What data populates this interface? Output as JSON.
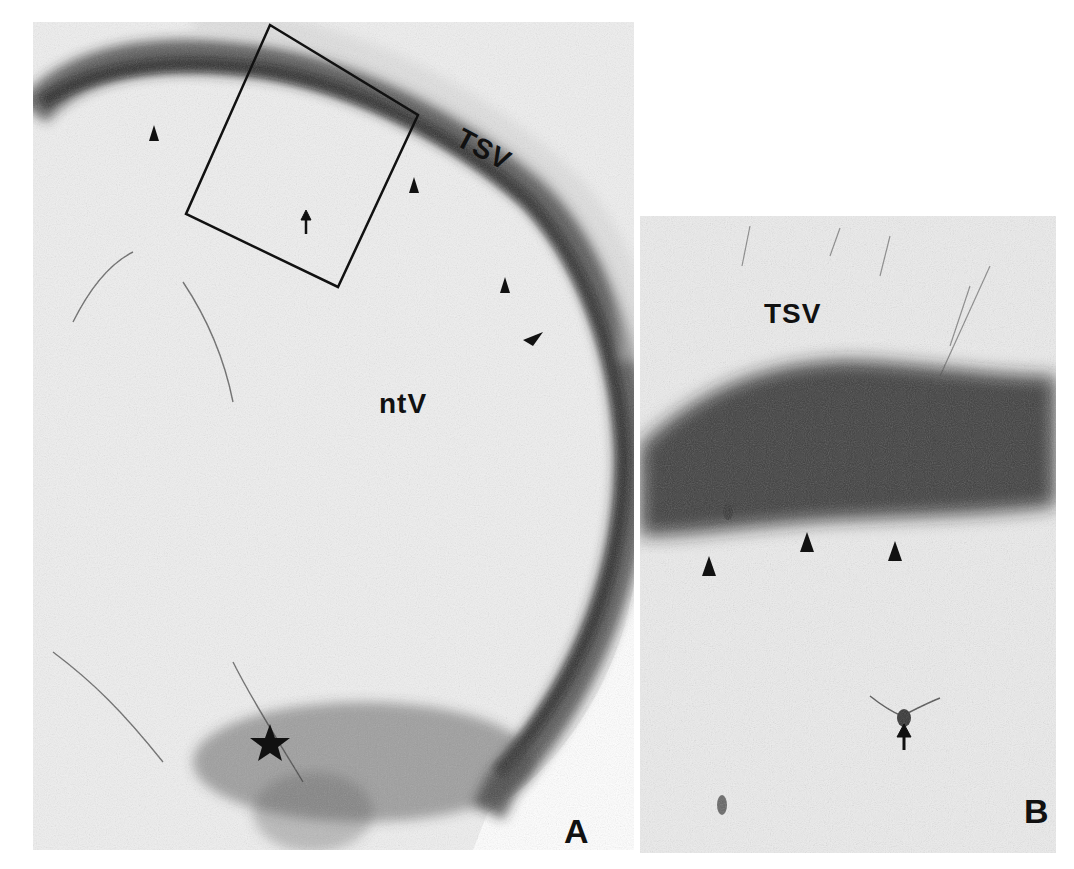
{
  "figure": {
    "panels": [
      {
        "id": "A",
        "letter": "A",
        "labels": {
          "tsv": "TSV",
          "ntv": "ntV"
        },
        "markers": {
          "inset_box": "rectangle outlining region enlarged in B",
          "arrow_count": 1,
          "arrowhead_count": 4,
          "star_count": 1
        }
      },
      {
        "id": "B",
        "letter": "B",
        "labels": {
          "tsv": "TSV"
        },
        "markers": {
          "arrow_count": 1,
          "arrowhead_count": 3
        }
      }
    ],
    "colors": {
      "background": "#ffffff",
      "tissue": "#ededed",
      "stain": "#1a1a1a",
      "ink": "#111111"
    }
  }
}
